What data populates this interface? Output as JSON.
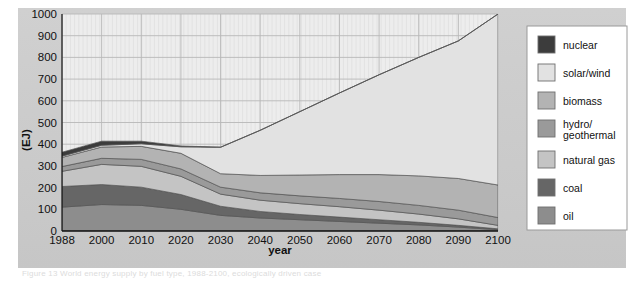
{
  "figure": {
    "background_color": "#c9c9c9",
    "plot_background_color": "#ededed",
    "caption": "Figure 13 World energy supply by fuel type, 1988-2100, ecologically driven case"
  },
  "chart_data": {
    "type": "area",
    "stacked": true,
    "title": "",
    "xlabel": "year",
    "ylabel": "(EJ)",
    "ylim": [
      0,
      1000
    ],
    "ytick_labels": [
      "0",
      "100",
      "200",
      "300",
      "400",
      "500",
      "600",
      "700",
      "800",
      "900",
      "1000"
    ],
    "yticks": [
      0,
      100,
      200,
      300,
      400,
      500,
      600,
      700,
      800,
      900,
      1000
    ],
    "x": [
      1988,
      2000,
      2010,
      2020,
      2030,
      2040,
      2050,
      2060,
      2070,
      2080,
      2090,
      2100
    ],
    "xtick_labels": [
      "1988",
      "2000",
      "2010",
      "2020",
      "2030",
      "2040",
      "2050",
      "2060",
      "2070",
      "2080",
      "2090",
      "2100"
    ],
    "grid": true,
    "legend_position": "right-outside",
    "stack_order_bottom_to_top": [
      "oil",
      "coal",
      "natural gas",
      "hydro/geothermal",
      "biomass",
      "solar/wind",
      "nuclear"
    ],
    "series": [
      {
        "name": "oil",
        "color": "#8d8d8d",
        "values": [
          110,
          122,
          118,
          100,
          72,
          60,
          52,
          44,
          36,
          28,
          18,
          6
        ]
      },
      {
        "name": "coal",
        "color": "#666666",
        "values": [
          95,
          92,
          84,
          68,
          42,
          30,
          24,
          20,
          16,
          12,
          8,
          4
        ]
      },
      {
        "name": "natural gas",
        "color": "#c4c4c4",
        "values": [
          70,
          93,
          96,
          84,
          56,
          52,
          50,
          48,
          44,
          38,
          30,
          16
        ]
      },
      {
        "name": "hydro/geothermal",
        "color": "#9a9a9a",
        "values": [
          22,
          28,
          32,
          34,
          32,
          34,
          36,
          38,
          40,
          40,
          40,
          36
        ]
      },
      {
        "name": "biomass",
        "color": "#b3b3b3",
        "values": [
          42,
          52,
          60,
          72,
          62,
          80,
          96,
          110,
          124,
          136,
          146,
          150
        ]
      },
      {
        "name": "solar/wind",
        "color": "#e2e2e2",
        "values": [
          6,
          8,
          12,
          30,
          122,
          208,
          292,
          376,
          460,
          546,
          634,
          788
        ]
      },
      {
        "name": "nuclear",
        "color": "#3c3c3c",
        "values": [
          18,
          19,
          12,
          4,
          0,
          0,
          0,
          0,
          0,
          0,
          0,
          0
        ]
      }
    ],
    "totals": [
      363,
      414,
      414,
      392,
      386,
      464,
      550,
      636,
      720,
      800,
      876,
      1000
    ]
  },
  "legend": {
    "items": [
      {
        "label": "nuclear",
        "color": "#3c3c3c"
      },
      {
        "label": "solar/wind",
        "color": "#e2e2e2"
      },
      {
        "label": "biomass",
        "color": "#b3b3b3"
      },
      {
        "label": "hydro/",
        "label2": "geothermal",
        "color": "#9a9a9a"
      },
      {
        "label": "natural gas",
        "color": "#c4c4c4"
      },
      {
        "label": "coal",
        "color": "#666666"
      },
      {
        "label": "oil",
        "color": "#8d8d8d"
      }
    ]
  }
}
